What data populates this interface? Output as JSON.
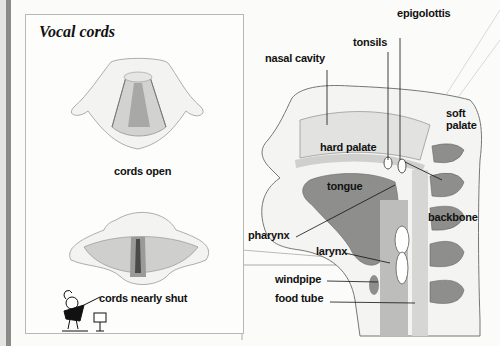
{
  "panel": {
    "title": "Vocal cords",
    "captions": {
      "open": "cords open",
      "shut": "cords nearly shut"
    }
  },
  "anatomy_labels": {
    "epiglottis": "epigolottis",
    "tonsils": "tonsils",
    "nasal_cavity": "nasal cavity",
    "soft_palate_1": "soft",
    "soft_palate_2": "palate",
    "hard_palate": "hard palate",
    "tongue": "tongue",
    "backbone": "backbone",
    "pharynx": "pharynx",
    "larynx": "larynx",
    "windpipe": "windpipe",
    "food_tube": "food tube"
  },
  "colors": {
    "tissue_dark": "#8e8e8c",
    "tissue_mid": "#c4c4c2",
    "tissue_light": "#e2e2e0",
    "ink": "#111111"
  }
}
